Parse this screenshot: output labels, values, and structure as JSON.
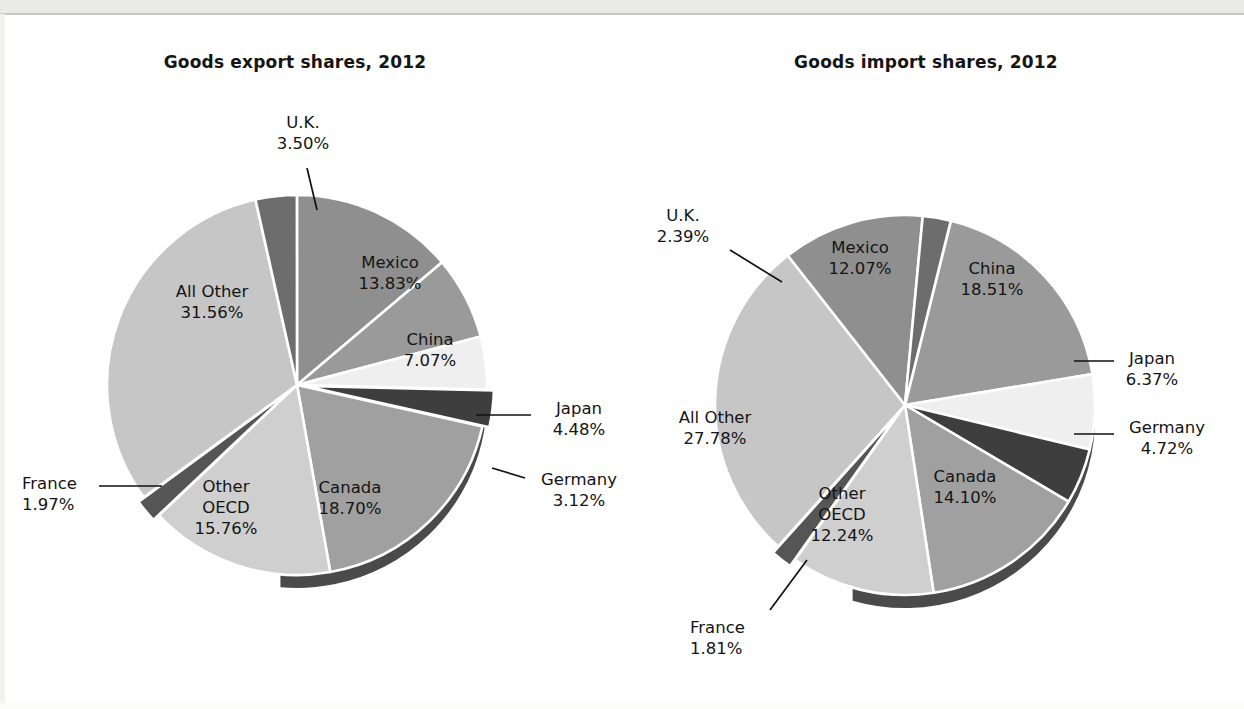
{
  "figure": {
    "background": "#ffffff",
    "scan_band_color": "#e9e9e6"
  },
  "chart_data": [
    {
      "type": "pie",
      "title": "Goods export shares, 2012",
      "id": "goods-export-shares-2012",
      "unit": "percent",
      "categories": [
        "Mexico",
        "China",
        "Japan",
        "Germany",
        "Canada",
        "Other OECD",
        "France",
        "All Other",
        "U.K."
      ],
      "values": [
        13.83,
        7.07,
        4.48,
        3.12,
        18.7,
        15.76,
        1.97,
        31.56,
        3.5
      ],
      "labels": [
        {
          "name": "U.K.",
          "value": "3.50%",
          "placement": "outside",
          "leader": true
        },
        {
          "name": "Mexico",
          "value": "13.83%",
          "placement": "inside",
          "leader": false
        },
        {
          "name": "China",
          "value": "7.07%",
          "placement": "inside",
          "leader": false
        },
        {
          "name": "Japan",
          "value": "4.48%",
          "placement": "outside",
          "leader": true
        },
        {
          "name": "Germany",
          "value": "3.12%",
          "placement": "outside",
          "leader": true
        },
        {
          "name": "Canada",
          "value": "18.70%",
          "placement": "inside",
          "leader": false
        },
        {
          "name": "Other OECD",
          "value": "15.76%",
          "placement": "inside",
          "leader": false
        },
        {
          "name": "France",
          "value": "1.97%",
          "placement": "outside",
          "leader": true
        },
        {
          "name": "All Other",
          "value": "31.56%",
          "placement": "inside",
          "leader": false
        }
      ],
      "slice_colors": [
        "#8f8f8f",
        "#9a9a9a",
        "#efefef",
        "#3e3e3e",
        "#a0a0a0",
        "#cfcfcf",
        "#555555",
        "#c6c6c6",
        "#6d6d6d"
      ],
      "legend": "none",
      "grid": false
    },
    {
      "type": "pie",
      "title": "Goods import shares, 2012",
      "id": "goods-import-shares-2012",
      "unit": "percent",
      "categories": [
        "China",
        "Japan",
        "Germany",
        "Canada",
        "Other OECD",
        "France",
        "All Other",
        "Mexico",
        "U.K."
      ],
      "values": [
        18.51,
        6.37,
        4.72,
        14.1,
        12.24,
        1.81,
        27.78,
        12.07,
        2.39
      ],
      "labels": [
        {
          "name": "U.K.",
          "value": "2.39%",
          "placement": "outside",
          "leader": true
        },
        {
          "name": "Mexico",
          "value": "12.07%",
          "placement": "inside",
          "leader": false
        },
        {
          "name": "China",
          "value": "18.51%",
          "placement": "inside",
          "leader": false
        },
        {
          "name": "Japan",
          "value": "6.37%",
          "placement": "outside",
          "leader": true
        },
        {
          "name": "Germany",
          "value": "4.72%",
          "placement": "outside",
          "leader": true
        },
        {
          "name": "Canada",
          "value": "14.10%",
          "placement": "inside",
          "leader": false
        },
        {
          "name": "Other OECD",
          "value": "12.24%",
          "placement": "inside",
          "leader": false
        },
        {
          "name": "France",
          "value": "1.81%",
          "placement": "outside",
          "leader": true
        },
        {
          "name": "All Other",
          "value": "27.78%",
          "placement": "inside",
          "leader": false
        }
      ],
      "slice_colors": [
        "#9a9a9a",
        "#efefef",
        "#3e3e3e",
        "#a0a0a0",
        "#cfcfcf",
        "#555555",
        "#c6c6c6",
        "#8f8f8f",
        "#6d6d6d"
      ],
      "legend": "none",
      "grid": false
    }
  ],
  "export_chart": {
    "title": "Goods export shares, 2012",
    "uk_name": "U.K.",
    "uk_value": "3.50%",
    "mexico_name": "Mexico",
    "mexico_value": "13.83%",
    "china_name": "China",
    "china_value": "7.07%",
    "japan_name": "Japan",
    "japan_value": "4.48%",
    "germany_name": "Germany",
    "germany_value": "3.12%",
    "canada_name": "Canada",
    "canada_value": "18.70%",
    "oecd_name_1": "Other",
    "oecd_name_2": "OECD",
    "oecd_value": "15.76%",
    "france_name": "France",
    "france_value": "1.97%",
    "allother_name": "All Other",
    "allother_value": "31.56%"
  },
  "import_chart": {
    "title": "Goods import shares, 2012",
    "uk_name": "U.K.",
    "uk_value": "2.39%",
    "mexico_name": "Mexico",
    "mexico_value": "12.07%",
    "china_name": "China",
    "china_value": "18.51%",
    "japan_name": "Japan",
    "japan_value": "6.37%",
    "germany_name": "Germany",
    "germany_value": "4.72%",
    "canada_name": "Canada",
    "canada_value": "14.10%",
    "oecd_name_1": "Other",
    "oecd_name_2": "OECD",
    "oecd_value": "12.24%",
    "france_name": "France",
    "france_value": "1.81%",
    "allother_name": "All Other",
    "allother_value": "27.78%"
  }
}
